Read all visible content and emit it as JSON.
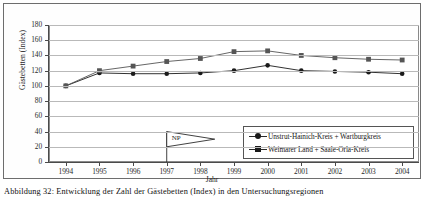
{
  "figure": {
    "caption": "Abbildung 32: Entwicklung der Zahl der Gästebetten (Index) in den Untersuchungsregionen",
    "annotation": {
      "label": "NP",
      "at_year": 1997
    }
  },
  "chart_data": {
    "type": "line",
    "title": "",
    "xlabel": "Jahr",
    "ylabel": "Gästebetten (Index)",
    "categories": [
      1994,
      1995,
      1996,
      1997,
      1998,
      1999,
      2000,
      2001,
      2002,
      2003,
      2004
    ],
    "x": [
      "1994",
      "1995",
      "1996",
      "1997",
      "1998",
      "1999",
      "2000",
      "2001",
      "2002",
      "2003",
      "2004"
    ],
    "ylim": [
      0,
      180
    ],
    "yticks": [
      0,
      20,
      40,
      60,
      80,
      100,
      120,
      140,
      160,
      180
    ],
    "ytick_labels": [
      "0",
      "20",
      "40",
      "60",
      "80",
      "100",
      "120",
      "140",
      "160",
      "180"
    ],
    "grid": true,
    "legend_position": "lower right",
    "series": [
      {
        "name": "Unstrut-Hainich-Kreis + Wartburgkreis",
        "marker": "circle",
        "color": "#1a1a1a",
        "values": [
          100,
          117,
          116,
          116,
          117,
          120,
          127,
          120,
          119,
          118,
          116
        ]
      },
      {
        "name": "Weimarer Land + Saale-Orla-Kreis",
        "marker": "square",
        "color": "#555555",
        "values": [
          100,
          120,
          126,
          132,
          136,
          145,
          146,
          140,
          137,
          135,
          134
        ]
      }
    ]
  }
}
